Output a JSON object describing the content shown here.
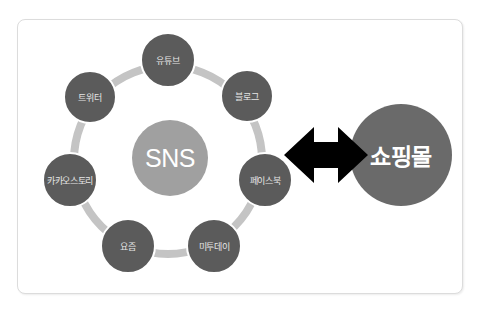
{
  "diagram": {
    "center": {
      "label": "SNS",
      "color": "#a0a0a0"
    },
    "ring_color": "#c4c4c4",
    "node_color": "#5b5b5b",
    "nodes": [
      {
        "label": "유튜브"
      },
      {
        "label": "블로그"
      },
      {
        "label": "페이스북"
      },
      {
        "label": "미투데이"
      },
      {
        "label": "요즘"
      },
      {
        "label": "카카오스토리"
      },
      {
        "label": "트위터"
      }
    ],
    "connector": {
      "type": "double-arrow",
      "color": "#000000"
    },
    "target": {
      "label": "쇼핑몰",
      "color": "#6a6a6a"
    }
  }
}
